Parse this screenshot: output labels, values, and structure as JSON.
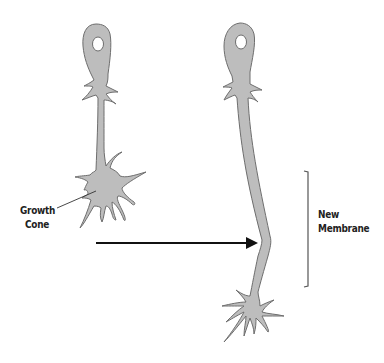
{
  "diagram": {
    "labels": {
      "growth_cone_line1": "Growth",
      "growth_cone_line2": "Cone",
      "new_membrane_line1": "New",
      "new_membrane_line2": "Membrane"
    },
    "colors": {
      "cell_fill": "#bdbdbd",
      "cell_stroke": "#6e6e6e",
      "arrow": "#111111",
      "bracket": "#555555",
      "text": "#222222"
    },
    "elements": [
      {
        "id": "neuron-before",
        "description": "Neuron with short axon ending in growth cone"
      },
      {
        "id": "neuron-after",
        "description": "Neuron with elongated axon ending in growth cone"
      },
      {
        "id": "time-arrow",
        "description": "Arrow pointing right from first neuron to second"
      },
      {
        "id": "new-membrane-bracket",
        "description": "Bracket indicating newly added membrane along the axon"
      }
    ]
  }
}
